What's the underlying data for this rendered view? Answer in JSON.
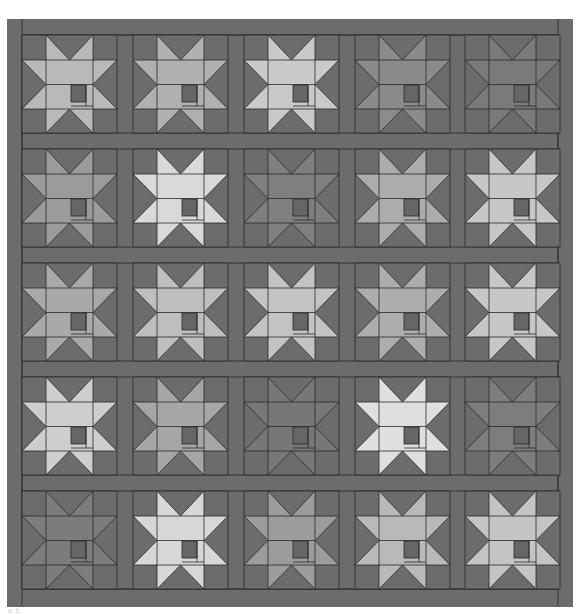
{
  "image": {
    "title": "Star quilt pattern",
    "description": "5x5 grid of sawtooth star blocks in grayscale with sashing and borders",
    "width": 581,
    "height": 614
  },
  "colors": {
    "page_background": "#ffffff",
    "fabric_background": "#6c6c6c",
    "seam_line": "#2a2a2a",
    "center_square": "#666666"
  },
  "layout": {
    "outer": {
      "x": 7,
      "y": 19,
      "w": 566,
      "h": 588
    },
    "inner": {
      "x": 22,
      "y": 35,
      "w": 536,
      "h": 554
    },
    "columns_x": [
      22,
      133,
      244,
      355,
      465
    ],
    "rows_y": [
      35,
      149,
      263,
      377,
      491
    ],
    "block_w": 95,
    "block_h": 98
  },
  "blocks": [
    [
      "#b9b9b9",
      "#b0b0b0",
      "#c9c9c9",
      "#8b8b8b",
      "#7a7a7a"
    ],
    [
      "#9b9b9b",
      "#d9d9d9",
      "#7f7f7f",
      "#acacac",
      "#c7c7c7"
    ],
    [
      "#a9a9a9",
      "#bebebe",
      "#c3c3c3",
      "#adadad",
      "#c7c7c7"
    ],
    [
      "#cecece",
      "#a6a6a6",
      "#777777",
      "#dfdfdf",
      "#7d7d7d"
    ],
    [
      "#7c7c7c",
      "#d7d7d7",
      "#9c9c9c",
      "#b9b9b9",
      "#c4c4c4"
    ]
  ],
  "caption": "a           b"
}
